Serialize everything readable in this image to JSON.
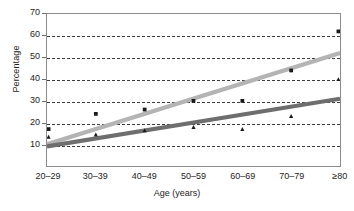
{
  "chart_data": {
    "type": "scatter",
    "title": "",
    "subtitle": "",
    "xlabel": "Age (years)",
    "ylabel": "Percentage",
    "categories": [
      "20–29",
      "30–39",
      "40–49",
      "50–59",
      "60–69",
      "70–79",
      "≥80"
    ],
    "ylim": [
      0,
      70
    ],
    "yticks": [
      10,
      20,
      30,
      40,
      50,
      60,
      70
    ],
    "gridlines": [
      10,
      20,
      30,
      40,
      50,
      60
    ],
    "grid": "horizontal-dashed",
    "legend": "none",
    "series": [
      {
        "name": "series-squares",
        "marker": "square",
        "color": "#1a1a1a",
        "trendline_color": "#b4b4b4",
        "values": [
          17,
          24,
          26,
          30,
          30,
          44,
          62
        ],
        "trendline": {
          "start": 10,
          "end": 52
        }
      },
      {
        "name": "series-triangles",
        "marker": "triangle",
        "color": "#1a1a1a",
        "trendline_color": "#6e6e6e",
        "values": [
          13.5,
          14.5,
          16.5,
          18,
          17,
          23,
          40
        ],
        "trendline": {
          "start": 9,
          "end": 31
        }
      }
    ]
  },
  "axis": {
    "y_title": "Percentage",
    "x_title": "Age (years)",
    "y_tick_labels": [
      "70",
      "60",
      "50",
      "40",
      "30",
      "20",
      "10"
    ],
    "x_tick_labels": [
      "20–29",
      "30–39",
      "40–49",
      "50–59",
      "60–69",
      "70–79",
      "≥80"
    ]
  },
  "colors": {
    "frame": "#8c8c8c",
    "grid": "#3c3c3c",
    "light_trend": "#b4b4b4",
    "dark_trend": "#6e6e6e",
    "marker": "#1a1a1a",
    "background": "#ffffff"
  }
}
